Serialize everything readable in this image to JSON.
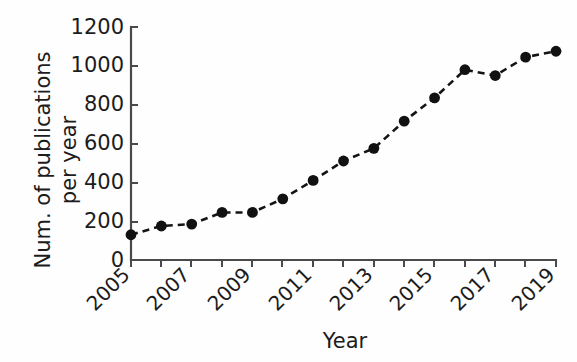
{
  "chart_data": {
    "type": "line",
    "title": "",
    "subtitle": "",
    "xlabel": "Year",
    "ylabel": "Num. of publications\nper year",
    "ylabel_line1": "Num. of publications",
    "ylabel_line2": "per year",
    "x": [
      2005,
      2006,
      2007,
      2008,
      2009,
      2010,
      2011,
      2012,
      2013,
      2014,
      2015,
      2016,
      2017,
      2018,
      2019
    ],
    "categories": [
      "2005",
      "2006",
      "2007",
      "2008",
      "2009",
      "2010",
      "2011",
      "2012",
      "2013",
      "2014",
      "2015",
      "2016",
      "2017",
      "2018",
      "2019"
    ],
    "values": [
      130,
      175,
      185,
      245,
      245,
      315,
      410,
      510,
      575,
      715,
      835,
      980,
      950,
      1045,
      1075
    ],
    "series": [
      {
        "name": "Num. of publications per year",
        "values": [
          130,
          175,
          185,
          245,
          245,
          315,
          410,
          510,
          575,
          715,
          835,
          980,
          950,
          1045,
          1075
        ],
        "line_style": "dashed",
        "marker": "filled-circle",
        "color": "#111111"
      }
    ],
    "xlim": [
      2005,
      2019
    ],
    "ylim": [
      0,
      1200
    ],
    "ytick_values": [
      0,
      200,
      400,
      600,
      800,
      1000,
      1200
    ],
    "ytick_labels": [
      "0",
      "200",
      "400",
      "600",
      "800",
      "1000",
      "1200"
    ],
    "xtick_values": [
      2005,
      2007,
      2009,
      2011,
      2013,
      2015,
      2017,
      2019
    ],
    "xtick_labels": [
      "2005",
      "2007",
      "2009",
      "2011",
      "2013",
      "2015",
      "2017",
      "2019"
    ],
    "xtick_minor_values": [
      2006,
      2008,
      2010,
      2012,
      2014,
      2016,
      2018
    ],
    "xtick_label_rotation": 45,
    "grid": false,
    "legend": false,
    "legend_position": "none",
    "axis_color": "#3a3a3a",
    "background_color": "#ffffff"
  }
}
